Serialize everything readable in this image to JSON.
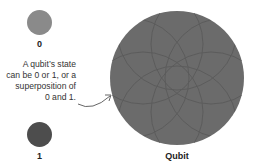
{
  "states": [
    {
      "label": "0",
      "color": "#8a8a8a"
    },
    {
      "label": "1",
      "color": "#4d4d4d"
    }
  ],
  "description": {
    "lines": [
      "A qubit’s state",
      "can be 0 or 1, or a",
      "superposition of",
      "0 and 1."
    ]
  },
  "qubit": {
    "label": "Qubit",
    "color": "#6b6b6b"
  }
}
